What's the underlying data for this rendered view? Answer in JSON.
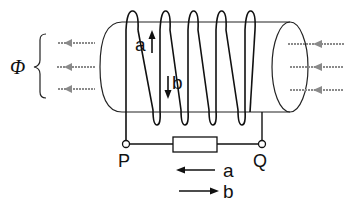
{
  "diagram": {
    "flux_label": "Φ",
    "terminals": {
      "left": "P",
      "right": "Q"
    },
    "coil_labels": {
      "up_arrow": "a",
      "down_arrow": "b"
    },
    "legend": [
      {
        "direction": "left",
        "label": "a"
      },
      {
        "direction": "right",
        "label": "b"
      }
    ],
    "colors": {
      "line": "#1a1a1a",
      "flux_arrows": "#8a8a8a",
      "background": "#ffffff"
    },
    "components": [
      "cylindrical core",
      "solenoid coil (5 turns)",
      "resistor",
      "terminal P",
      "terminal Q"
    ]
  }
}
